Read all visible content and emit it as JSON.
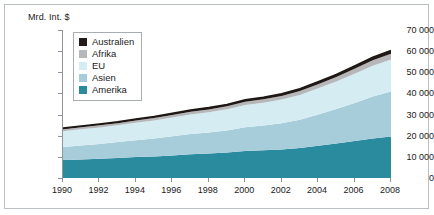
{
  "axis_title": "Mrd. Int. $",
  "legend": {
    "items": [
      {
        "label": "Australien",
        "color": "#241a17"
      },
      {
        "label": "Afrika",
        "color": "#b6b7b8"
      },
      {
        "label": "EU",
        "color": "#d5ecf2"
      },
      {
        "label": "Asien",
        "color": "#a8cdda"
      },
      {
        "label": "Amerika",
        "color": "#2a8a9e"
      }
    ]
  },
  "chart_data": {
    "type": "area",
    "title": "",
    "xlabel": "",
    "ylabel": "Mrd. Int. $",
    "stacked": true,
    "grid": true,
    "legend_position": "top-left",
    "x": [
      1990,
      1991,
      1992,
      1993,
      1994,
      1995,
      1996,
      1997,
      1998,
      1999,
      2000,
      2001,
      2002,
      2003,
      2004,
      2005,
      2006,
      2007,
      2008
    ],
    "xticks": [
      1990,
      1992,
      1994,
      1996,
      1998,
      2000,
      2002,
      2004,
      2006,
      2008
    ],
    "xtick_labels": [
      "1990",
      "1992",
      "1994",
      "1996",
      "1998",
      "2000",
      "2002",
      "2004",
      "2006",
      "2008"
    ],
    "xlim": [
      1990,
      2008
    ],
    "yticks": [
      0,
      10000,
      20000,
      30000,
      40000,
      50000,
      60000,
      70000
    ],
    "ytick_labels": [
      "0",
      "10 000",
      "20 000",
      "30 000",
      "40 000",
      "50 000",
      "60 000",
      "70 000"
    ],
    "ylim": [
      0,
      70000
    ],
    "series": [
      {
        "name": "Amerika",
        "color": "#2a8a9e",
        "values": [
          8500,
          8800,
          9100,
          9500,
          9900,
          10200,
          10700,
          11200,
          11600,
          12100,
          12800,
          13100,
          13500,
          14200,
          15200,
          16300,
          17500,
          18700,
          19600
        ]
      },
      {
        "name": "Asien",
        "color": "#a8cdda",
        "values": [
          6200,
          6600,
          7000,
          7500,
          8000,
          8500,
          9100,
          9600,
          9900,
          10400,
          11200,
          11700,
          12400,
          13400,
          14800,
          16300,
          18000,
          19800,
          21300
        ]
      },
      {
        "name": "EU",
        "color": "#d5ecf2",
        "values": [
          7400,
          7600,
          7800,
          7900,
          8200,
          8500,
          8800,
          9200,
          9600,
          10000,
          10500,
          10800,
          11200,
          11700,
          12400,
          13000,
          13800,
          14600,
          15200
        ]
      },
      {
        "name": "Afrika",
        "color": "#b6b7b8",
        "values": [
          900,
          950,
          1000,
          1050,
          1100,
          1150,
          1200,
          1280,
          1350,
          1420,
          1520,
          1600,
          1700,
          1820,
          1980,
          2150,
          2350,
          2550,
          2700
        ]
      },
      {
        "name": "Australien",
        "color": "#241a17",
        "values": [
          600,
          620,
          640,
          670,
          700,
          730,
          770,
          810,
          840,
          880,
          930,
          970,
          1020,
          1080,
          1160,
          1240,
          1330,
          1420,
          1500
        ]
      }
    ],
    "totals": [
      23600,
      24570,
      25540,
      26620,
      27900,
      29080,
      30570,
      32090,
      33290,
      34800,
      36950,
      38170,
      39820,
      42200,
      45540,
      48990,
      52980,
      57070,
      60300
    ]
  }
}
